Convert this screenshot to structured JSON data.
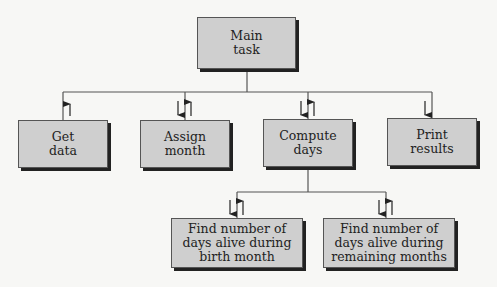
{
  "diagram": {
    "type": "structure-chart",
    "colors": {
      "box_fill": "#cfcfcf",
      "line": "#555555",
      "shadow": "#222222",
      "background": "#f7f7f5"
    },
    "root": {
      "label": "Main\ntask"
    },
    "level1": [
      {
        "label": "Get\ndata",
        "arrows": [
          "up"
        ]
      },
      {
        "label": "Assign\nmonth",
        "arrows": [
          "down",
          "up"
        ]
      },
      {
        "label": "Compute\ndays",
        "arrows": [
          "down",
          "up"
        ]
      },
      {
        "label": "Print\nresults",
        "arrows": [
          "down"
        ]
      }
    ],
    "level2_parent": "Compute\ndays",
    "level2": [
      {
        "label": "Find number of\ndays alive during\nbirth month",
        "arrows": [
          "down",
          "up"
        ]
      },
      {
        "label": "Find number of\ndays alive during\nremaining months",
        "arrows": [
          "down",
          "up"
        ]
      }
    ]
  }
}
